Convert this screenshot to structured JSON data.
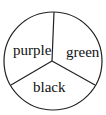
{
  "diagram": {
    "type": "spinner",
    "sections": [
      {
        "label": "purple",
        "position": "upper-left"
      },
      {
        "label": "green",
        "position": "upper-right"
      },
      {
        "label": "black",
        "position": "bottom"
      }
    ],
    "stroke_color": "#222222",
    "fill_color": "#ffffff"
  }
}
